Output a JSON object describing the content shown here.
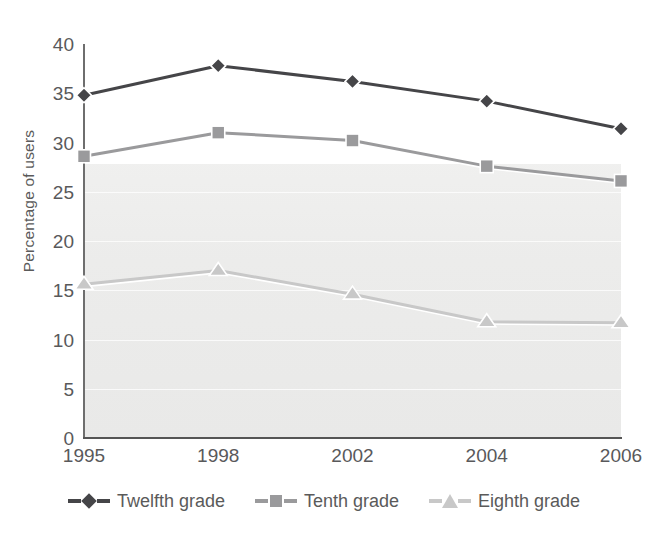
{
  "chart_data": {
    "type": "line",
    "title": "",
    "xlabel": "",
    "ylabel": "Percentage of users",
    "categories": [
      "1995",
      "1998",
      "2002",
      "2004",
      "2006"
    ],
    "ylim": [
      0,
      40
    ],
    "yticks": [
      0,
      5,
      10,
      15,
      20,
      25,
      30,
      35,
      40
    ],
    "ytick_labels": [
      "0",
      "5",
      "10",
      "15",
      "20",
      "25",
      "30",
      "35",
      "40"
    ],
    "grid": "horizontal-faint",
    "legend_position": "bottom-center",
    "series": [
      {
        "name": "Twelfth grade",
        "marker": "diamond",
        "color": "#454548",
        "values": [
          34.8,
          37.8,
          36.2,
          34.2,
          31.4
        ]
      },
      {
        "name": "Tenth grade",
        "marker": "square",
        "color": "#9a9a9c",
        "values": [
          28.6,
          31.0,
          30.2,
          27.6,
          26.1
        ]
      },
      {
        "name": "Eighth grade",
        "marker": "triangle",
        "color": "#c8c8c8",
        "values": [
          15.6,
          17.0,
          14.6,
          11.8,
          11.7
        ]
      }
    ]
  },
  "axis": {
    "y_title": "Percentage of users"
  },
  "legend": {
    "items": [
      {
        "label": "Twelfth grade",
        "color": "#454548",
        "marker": "diamond"
      },
      {
        "label": "Tenth grade",
        "color": "#9a9a9c",
        "marker": "square"
      },
      {
        "label": "Eighth grade",
        "color": "#c8c8c8",
        "marker": "triangle"
      }
    ]
  },
  "colors": {
    "twelfth": "#454548",
    "tenth": "#9a9a9c",
    "eighth": "#c8c8c8",
    "axis": "#6e6e6e",
    "text": "#59595b",
    "plot_shade": "#ececeb"
  }
}
